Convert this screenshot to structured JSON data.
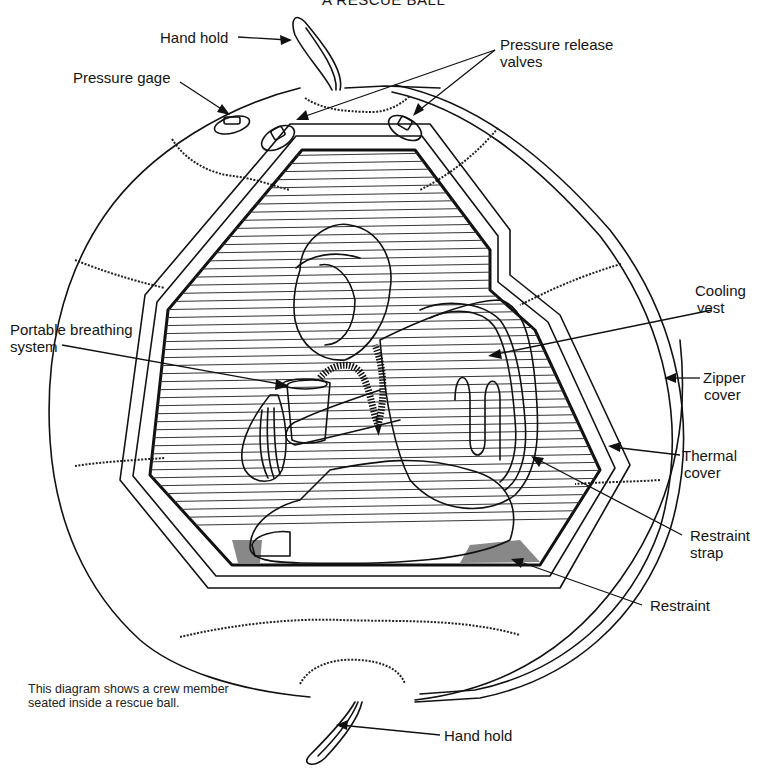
{
  "title": "A RESCUE BALL",
  "labels": {
    "hand_hold_top": "Hand hold",
    "pressure_gage": "Pressure gage",
    "pressure_release_valves_line1": "Pressure release",
    "pressure_release_valves_line2": "valves",
    "cooling_vest_line1": "Cooling",
    "cooling_vest_line2": "vest",
    "portable_breathing_line1": "Portable breathing",
    "portable_breathing_line2": "system",
    "zipper_cover_line1": "Zipper",
    "zipper_cover_line2": "cover",
    "thermal_cover_line1": "Thermal",
    "thermal_cover_line2": "cover",
    "restraint_strap_line1": "Restraint",
    "restraint_strap_line2": "strap",
    "restraint": "Restraint",
    "hand_hold_bottom": "Hand hold"
  },
  "caption": "This diagram shows a crew member seated inside a rescue ball.",
  "colors": {
    "ink": "#111111",
    "background": "#ffffff"
  }
}
